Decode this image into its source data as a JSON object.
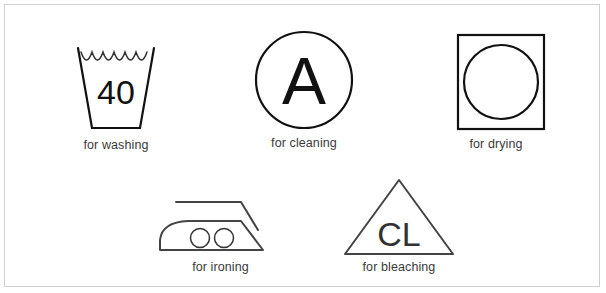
{
  "page": {
    "background_color": "#ffffff",
    "border_color": "#cfcfcf",
    "stroke_color": "#111111",
    "caption_color": "#3a3a3a",
    "width": 606,
    "height": 293
  },
  "symbols": [
    {
      "id": "washing",
      "icon_name": "wash-tub-icon",
      "inner_text": "40",
      "caption": "for washing",
      "shape": "trapezoid-tub-with-wave"
    },
    {
      "id": "cleaning",
      "icon_name": "dry-clean-circle-icon",
      "inner_text": "A",
      "caption": "for cleaning",
      "shape": "circle"
    },
    {
      "id": "drying",
      "icon_name": "tumble-dry-square-icon",
      "inner_text": "",
      "caption": "for drying",
      "shape": "square-with-circle"
    },
    {
      "id": "ironing",
      "icon_name": "iron-icon",
      "inner_text": "",
      "caption": "for ironing",
      "shape": "iron-with-two-dots"
    },
    {
      "id": "bleaching",
      "icon_name": "bleach-triangle-icon",
      "inner_text": "CL",
      "caption": "for bleaching",
      "shape": "triangle"
    }
  ]
}
